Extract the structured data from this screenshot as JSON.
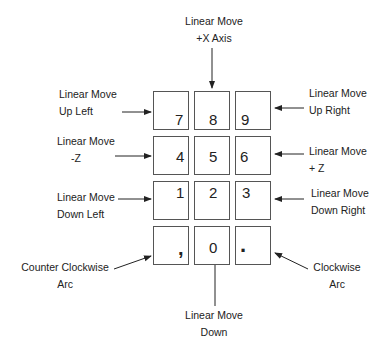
{
  "diagram": {
    "type": "keypad-legend",
    "keys": [
      {
        "id": "7",
        "label": "7",
        "arrow": "up-left"
      },
      {
        "id": "8",
        "label": "8",
        "arrow": "up"
      },
      {
        "id": "9",
        "label": "9",
        "arrow": "up-right"
      },
      {
        "id": "4",
        "label": "4",
        "arrow": "left"
      },
      {
        "id": "5",
        "label": "5",
        "arrow": "none"
      },
      {
        "id": "6",
        "label": "6",
        "arrow": "right"
      },
      {
        "id": "1",
        "label": "1",
        "arrow": "down-left"
      },
      {
        "id": "2",
        "label": "2",
        "arrow": "down"
      },
      {
        "id": "3",
        "label": "3",
        "arrow": "down-right"
      },
      {
        "id": "comma",
        "label": ",",
        "arrow": "counter-clockwise-arc"
      },
      {
        "id": "0",
        "label": "0",
        "arrow": "none"
      },
      {
        "id": "period",
        "label": ".",
        "arrow": "clockwise-arc"
      }
    ],
    "callouts": {
      "key8": {
        "line1": "Linear  Move",
        "line2": "+X Axis"
      },
      "key7": {
        "line1": "Linear  Move",
        "line2": "Up  Left"
      },
      "key9": {
        "line1": "Linear  Move",
        "line2": "Up  Right"
      },
      "key4": {
        "line1": "Linear  Move",
        "line2": "-Z"
      },
      "key6": {
        "line1": "Linear  Move",
        "line2": "+ Z"
      },
      "key1": {
        "line1": "Linear  Move",
        "line2": "Down  Left"
      },
      "key3": {
        "line1": "Linear  Move",
        "line2": "Down   Right"
      },
      "keycomma": {
        "line1": "Counter  Clockwise",
        "line2": "Arc"
      },
      "keyperiod": {
        "line1": "Clockwise",
        "line2": "Arc"
      },
      "key0": {
        "line1": "Linear  Move",
        "line2": "Down"
      }
    },
    "colors": {
      "line": "#222222",
      "border": "#555555",
      "background": "#ffffff"
    }
  }
}
